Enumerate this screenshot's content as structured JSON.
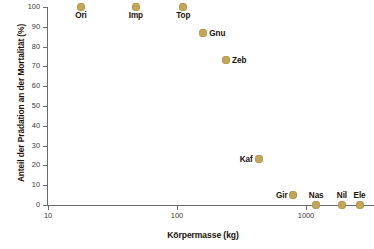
{
  "chart_data": {
    "type": "scatter",
    "title": "",
    "xlabel": "Körpermasse (kg)",
    "ylabel": "Anteil der Prädation an der Mortalität (%)",
    "xscale": "log",
    "xlim": [
      10,
      3000
    ],
    "ylim": [
      0,
      100
    ],
    "grid": false,
    "legend": false,
    "marker_color": "#c2a558",
    "label_color": "#1a1008",
    "axis_color": "#6b6b6b",
    "xticks": [
      {
        "value": 10,
        "label": "10"
      },
      {
        "value": 100,
        "label": "100"
      },
      {
        "value": 1000,
        "label": "1000"
      }
    ],
    "yticks": [
      {
        "value": 0,
        "label": "0"
      },
      {
        "value": 10,
        "label": "10"
      },
      {
        "value": 20,
        "label": "20"
      },
      {
        "value": 30,
        "label": "30"
      },
      {
        "value": 40,
        "label": "40"
      },
      {
        "value": 50,
        "label": "50"
      },
      {
        "value": 60,
        "label": "60"
      },
      {
        "value": 70,
        "label": "70"
      },
      {
        "value": 80,
        "label": "80"
      },
      {
        "value": 90,
        "label": "90"
      },
      {
        "value": 100,
        "label": "100"
      }
    ],
    "points": [
      {
        "label": "Ori",
        "x": 18,
        "y": 100,
        "label_pos": "below"
      },
      {
        "label": "Imp",
        "x": 48,
        "y": 100,
        "label_pos": "below"
      },
      {
        "label": "Top",
        "x": 112,
        "y": 100,
        "label_pos": "below"
      },
      {
        "label": "Gnu",
        "x": 160,
        "y": 87,
        "label_pos": "right"
      },
      {
        "label": "Zeb",
        "x": 240,
        "y": 73,
        "label_pos": "right"
      },
      {
        "label": "Kaf",
        "x": 430,
        "y": 23,
        "label_pos": "left"
      },
      {
        "label": "Gir",
        "x": 800,
        "y": 5,
        "label_pos": "left"
      },
      {
        "label": "Nas",
        "x": 1200,
        "y": 0,
        "label_pos": "above"
      },
      {
        "label": "Nil",
        "x": 1900,
        "y": 0,
        "label_pos": "above"
      },
      {
        "label": "Ele",
        "x": 2600,
        "y": 0,
        "label_pos": "above"
      }
    ]
  }
}
